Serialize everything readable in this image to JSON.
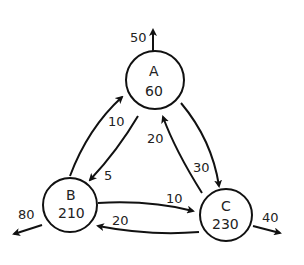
{
  "diagram": {
    "type": "flow-network",
    "nodes": [
      {
        "id": "A",
        "value": "60"
      },
      {
        "id": "B",
        "value": "210"
      },
      {
        "id": "C",
        "value": "230"
      }
    ],
    "edges": [
      {
        "from": "B",
        "to": "A",
        "label": "10"
      },
      {
        "from": "A",
        "to": "B",
        "label": "5"
      },
      {
        "from": "A",
        "to": "C",
        "label": "30"
      },
      {
        "from": "C",
        "to": "A",
        "label": "20"
      },
      {
        "from": "B",
        "to": "C",
        "label": "10"
      },
      {
        "from": "C",
        "to": "B",
        "label": "20"
      }
    ],
    "outflows": [
      {
        "from": "A",
        "label": "50"
      },
      {
        "from": "B",
        "label": "80"
      },
      {
        "from": "C",
        "label": "40"
      }
    ]
  }
}
